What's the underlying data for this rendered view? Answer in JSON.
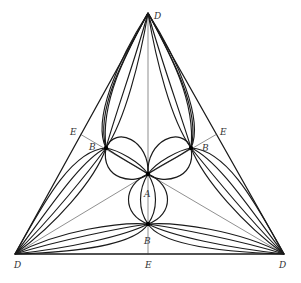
{
  "diagram": {
    "type": "triangular flow-line construction",
    "vertices": {
      "D_top": [
        148,
        13
      ],
      "D_left": [
        15,
        254
      ],
      "D_right": [
        284,
        254
      ]
    },
    "points": {
      "A": [
        148,
        174
      ],
      "B_left": [
        106,
        148
      ],
      "B_right": [
        191,
        148
      ],
      "B_bottom": [
        148,
        224
      ],
      "E_left": [
        80,
        134
      ],
      "E_right": [
        217,
        134
      ],
      "E_bottom": [
        148,
        255
      ]
    },
    "labels": [
      {
        "id": "label-D-top",
        "text": "D",
        "x": 154,
        "y": 19
      },
      {
        "id": "label-D-left",
        "text": "D",
        "x": 14,
        "y": 268
      },
      {
        "id": "label-D-right",
        "text": "D",
        "x": 279,
        "y": 268
      },
      {
        "id": "label-E-left",
        "text": "E",
        "x": 70,
        "y": 135
      },
      {
        "id": "label-E-right",
        "text": "E",
        "x": 220,
        "y": 135
      },
      {
        "id": "label-E-bottom",
        "text": "E",
        "x": 145,
        "y": 268
      },
      {
        "id": "label-B-left",
        "text": "B",
        "x": 89,
        "y": 150
      },
      {
        "id": "label-B-right",
        "text": "B",
        "x": 202,
        "y": 151
      },
      {
        "id": "label-B-bottom",
        "text": "B",
        "x": 144,
        "y": 244
      },
      {
        "id": "label-A",
        "text": "A",
        "x": 144,
        "y": 197
      }
    ],
    "colors": {
      "ink": "#1a1a1a",
      "construction": "#444444",
      "background": "#ffffff"
    }
  }
}
